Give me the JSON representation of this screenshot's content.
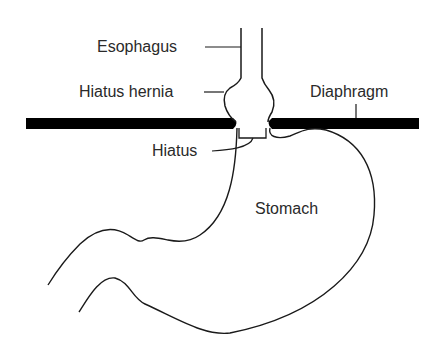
{
  "diagram": {
    "labels": {
      "esophagus": "Esophagus",
      "hiatus_hernia": "Hiatus hernia",
      "diaphragm": "Diaphragm",
      "hiatus": "Hiatus",
      "stomach": "Stomach"
    },
    "colors": {
      "line": "#1a1a1a",
      "diaphragm": "#000000",
      "text": "#2a2a2a",
      "background": "#ffffff"
    }
  }
}
